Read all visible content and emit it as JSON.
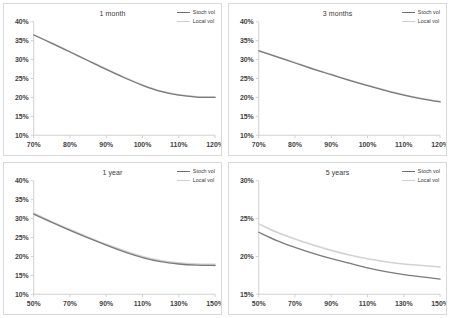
{
  "figure": {
    "panel_count": 4,
    "legend_labels": {
      "stoch": "Stoch vol",
      "local": "Local vol"
    },
    "colors": {
      "stoch": "#7a7a7a",
      "local": "#d2d2d2",
      "axis": "#d0d0d0",
      "text": "#3f3f3f",
      "border": "#d9d9d9",
      "background": "#ffffff"
    }
  },
  "chart_data": [
    {
      "type": "line",
      "title": "1 month",
      "xlabel": "",
      "ylabel": "",
      "xlim": [
        70,
        120
      ],
      "ylim": [
        10,
        40
      ],
      "xticks": [
        70,
        80,
        90,
        100,
        110,
        120
      ],
      "xticklabels": [
        "70%",
        "80%",
        "90%",
        "100%",
        "110%",
        "120%"
      ],
      "yticks": [
        10,
        15,
        20,
        25,
        30,
        35,
        40
      ],
      "yticklabels": [
        "10%",
        "15%",
        "20%",
        "25%",
        "30%",
        "35%",
        "40%"
      ],
      "grid": false,
      "legend_position": "top-right",
      "x": [
        70,
        75,
        80,
        85,
        90,
        95,
        100,
        105,
        110,
        115,
        120
      ],
      "series": [
        {
          "name": "Stoch vol",
          "values": [
            36.5,
            34.3,
            32.0,
            29.7,
            27.4,
            25.2,
            23.2,
            21.6,
            20.6,
            20.1,
            20.0
          ]
        },
        {
          "name": "Local vol",
          "values": [
            36.6,
            34.4,
            32.1,
            29.8,
            27.5,
            25.3,
            23.3,
            21.7,
            20.7,
            20.2,
            20.1
          ]
        }
      ]
    },
    {
      "type": "line",
      "title": "3 months",
      "xlabel": "",
      "ylabel": "",
      "xlim": [
        70,
        120
      ],
      "ylim": [
        10,
        40
      ],
      "xticks": [
        70,
        80,
        90,
        100,
        110,
        120
      ],
      "xticklabels": [
        "70%",
        "80%",
        "90%",
        "100%",
        "110%",
        "120%"
      ],
      "yticks": [
        10,
        15,
        20,
        25,
        30,
        35,
        40
      ],
      "yticklabels": [
        "10%",
        "15%",
        "20%",
        "25%",
        "30%",
        "35%",
        "40%"
      ],
      "grid": false,
      "legend_position": "top-right",
      "x": [
        70,
        75,
        80,
        85,
        90,
        95,
        100,
        105,
        110,
        115,
        120
      ],
      "series": [
        {
          "name": "Stoch vol",
          "values": [
            32.3,
            30.7,
            29.1,
            27.5,
            26.0,
            24.5,
            23.1,
            21.8,
            20.6,
            19.6,
            18.8
          ]
        },
        {
          "name": "Local vol",
          "values": [
            32.4,
            30.8,
            29.2,
            27.6,
            26.1,
            24.6,
            23.2,
            21.9,
            20.7,
            19.7,
            18.9
          ]
        }
      ]
    },
    {
      "type": "line",
      "title": "1 year",
      "xlabel": "",
      "ylabel": "",
      "xlim": [
        50,
        150
      ],
      "ylim": [
        10,
        40
      ],
      "xticks": [
        50,
        70,
        90,
        110,
        130,
        150
      ],
      "xticklabels": [
        "50%",
        "70%",
        "90%",
        "110%",
        "130%",
        "150%"
      ],
      "yticks": [
        10,
        15,
        20,
        25,
        30,
        35,
        40
      ],
      "yticklabels": [
        "10%",
        "15%",
        "20%",
        "25%",
        "30%",
        "35%",
        "40%"
      ],
      "grid": false,
      "legend_position": "top-right",
      "x": [
        50,
        60,
        70,
        80,
        90,
        100,
        110,
        120,
        130,
        140,
        150
      ],
      "series": [
        {
          "name": "Stoch vol",
          "values": [
            31.2,
            29.0,
            26.9,
            24.9,
            23.0,
            21.2,
            19.7,
            18.6,
            18.0,
            17.7,
            17.6
          ]
        },
        {
          "name": "Local vol",
          "values": [
            31.4,
            29.2,
            27.1,
            25.1,
            23.2,
            21.5,
            20.0,
            18.9,
            18.3,
            18.0,
            17.9
          ]
        }
      ]
    },
    {
      "type": "line",
      "title": "5 years",
      "xlabel": "",
      "ylabel": "",
      "xlim": [
        50,
        150
      ],
      "ylim": [
        15,
        30
      ],
      "xticks": [
        50,
        70,
        90,
        110,
        130,
        150
      ],
      "xticklabels": [
        "50%",
        "70%",
        "90%",
        "110%",
        "130%",
        "150%"
      ],
      "yticks": [
        15,
        20,
        25,
        30
      ],
      "yticklabels": [
        "15%",
        "20%",
        "25%",
        "30%"
      ],
      "grid": false,
      "legend_position": "top-right",
      "x": [
        50,
        60,
        70,
        80,
        90,
        100,
        110,
        120,
        130,
        140,
        150
      ],
      "series": [
        {
          "name": "Stoch vol",
          "values": [
            23.2,
            22.1,
            21.2,
            20.4,
            19.7,
            19.1,
            18.5,
            18.0,
            17.6,
            17.3,
            17.0
          ]
        },
        {
          "name": "Local vol",
          "values": [
            24.3,
            23.2,
            22.3,
            21.5,
            20.8,
            20.2,
            19.7,
            19.3,
            19.0,
            18.8,
            18.6
          ]
        }
      ]
    }
  ]
}
